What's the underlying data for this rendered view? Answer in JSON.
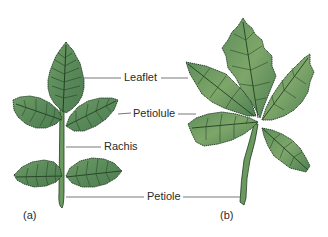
{
  "figure": {
    "colors": {
      "background": "#ffffff",
      "leaf_fill": "#5f9060",
      "leaf_fill_light": "#7aa56c",
      "leaf_edge": "#1f3a22",
      "vein": "#2b4a2a",
      "stem": "#6a9a5e",
      "leader_line": "#555555",
      "text": "#2a2a2a"
    },
    "labels": {
      "leaflet": "Leaflet",
      "petiolule": "Petiolule",
      "rachis": "Rachis",
      "petiole": "Petiole"
    },
    "panels": {
      "a": {
        "label": "(a)",
        "description": "Pinnately compound leaf"
      },
      "b": {
        "label": "(b)",
        "description": "Palmately compound leaf"
      }
    }
  }
}
